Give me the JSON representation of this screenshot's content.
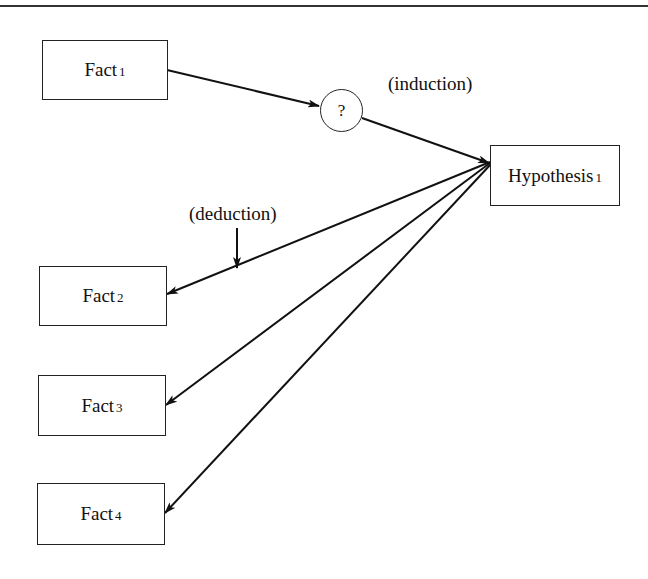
{
  "diagram": {
    "nodes": {
      "fact1": {
        "name": "Fact",
        "sub": "1"
      },
      "question": {
        "label": "?"
      },
      "hypothesis": {
        "name": "Hypothesis",
        "sub": "1"
      },
      "fact2": {
        "name": "Fact",
        "sub": "2"
      },
      "fact3": {
        "name": "Fact",
        "sub": "3"
      },
      "fact4": {
        "name": "Fact",
        "sub": "4"
      }
    },
    "labels": {
      "induction": "(induction)",
      "deduction": "(deduction)"
    },
    "edges": [
      {
        "from": "fact1",
        "to": "question"
      },
      {
        "from": "question",
        "to": "hypothesis",
        "label": "induction"
      },
      {
        "from": "hypothesis",
        "to": "fact2",
        "label": "deduction"
      },
      {
        "from": "hypothesis",
        "to": "fact3"
      },
      {
        "from": "hypothesis",
        "to": "fact4"
      }
    ]
  }
}
